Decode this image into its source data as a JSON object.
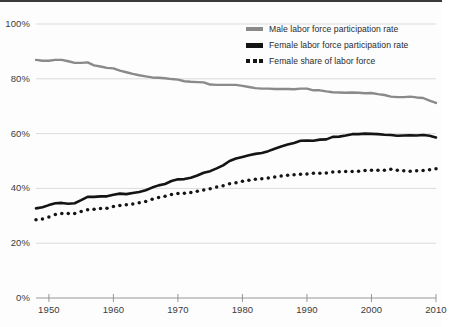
{
  "chart_data": {
    "type": "line",
    "title": "",
    "xlabel": "",
    "ylabel": "",
    "xlim": [
      1948,
      2010
    ],
    "ylim": [
      0,
      100
    ],
    "grid": true,
    "legend_position": "top-right",
    "ytick_labels": [
      "100%",
      "80%",
      "60%",
      "40%",
      "20%",
      "0%"
    ],
    "ytick_values": [
      100,
      80,
      60,
      40,
      20,
      0
    ],
    "xtick_labels": [
      "1950",
      "1960",
      "1970",
      "1980",
      "1990",
      "2000",
      "2010"
    ],
    "xtick_values": [
      1950,
      1960,
      1970,
      1980,
      1990,
      2000,
      2010
    ],
    "x": [
      1948,
      1949,
      1950,
      1951,
      1952,
      1953,
      1954,
      1955,
      1956,
      1957,
      1958,
      1959,
      1960,
      1961,
      1962,
      1963,
      1964,
      1965,
      1966,
      1967,
      1968,
      1969,
      1970,
      1971,
      1972,
      1973,
      1974,
      1975,
      1976,
      1977,
      1978,
      1979,
      1980,
      1981,
      1982,
      1983,
      1984,
      1985,
      1986,
      1987,
      1988,
      1989,
      1990,
      1991,
      1992,
      1993,
      1994,
      1995,
      1996,
      1997,
      1998,
      1999,
      2000,
      2001,
      2002,
      2003,
      2004,
      2005,
      2006,
      2007,
      2008,
      2009,
      2010
    ],
    "series": [
      {
        "name": "Male labor force participation rate",
        "color": "#8a8a8a",
        "style": "solid",
        "values": [
          86.9,
          86.6,
          86.6,
          86.9,
          86.9,
          86.4,
          85.8,
          85.8,
          86.0,
          84.9,
          84.5,
          84.0,
          83.8,
          83.0,
          82.4,
          81.8,
          81.3,
          80.9,
          80.5,
          80.4,
          80.2,
          79.9,
          79.7,
          79.1,
          78.9,
          78.8,
          78.7,
          77.9,
          77.8,
          77.8,
          77.8,
          77.8,
          77.4,
          77.0,
          76.6,
          76.4,
          76.4,
          76.3,
          76.3,
          76.3,
          76.2,
          76.4,
          76.4,
          75.8,
          75.8,
          75.4,
          75.1,
          75.0,
          74.9,
          75.0,
          74.9,
          74.7,
          74.8,
          74.4,
          74.1,
          73.5,
          73.3,
          73.3,
          73.5,
          73.2,
          73.0,
          72.0,
          71.2
        ]
      },
      {
        "name": "Female labor force participation rate",
        "color": "#141414",
        "style": "solid",
        "values": [
          32.7,
          33.1,
          33.9,
          34.6,
          34.7,
          34.4,
          34.6,
          35.7,
          36.9,
          36.9,
          37.1,
          37.1,
          37.7,
          38.1,
          37.9,
          38.3,
          38.7,
          39.3,
          40.3,
          41.1,
          41.6,
          42.7,
          43.3,
          43.4,
          43.9,
          44.7,
          45.7,
          46.3,
          47.3,
          48.4,
          50.0,
          50.9,
          51.5,
          52.1,
          52.6,
          52.9,
          53.6,
          54.5,
          55.3,
          56.0,
          56.6,
          57.4,
          57.5,
          57.4,
          57.8,
          57.9,
          58.8,
          58.9,
          59.3,
          59.8,
          59.8,
          60.0,
          59.9,
          59.8,
          59.6,
          59.5,
          59.2,
          59.3,
          59.4,
          59.3,
          59.5,
          59.2,
          58.6
        ]
      },
      {
        "name": "Female share of labor force",
        "color": "#141414",
        "style": "dotted",
        "values": [
          28.6,
          28.8,
          29.6,
          30.5,
          30.8,
          30.8,
          30.8,
          31.6,
          32.2,
          32.4,
          32.7,
          32.8,
          33.4,
          33.8,
          34.0,
          34.3,
          34.8,
          35.2,
          36.0,
          36.7,
          37.1,
          37.8,
          38.1,
          38.2,
          38.5,
          39.0,
          39.4,
          39.9,
          40.5,
          41.0,
          41.7,
          42.1,
          42.6,
          43.0,
          43.3,
          43.5,
          43.8,
          44.2,
          44.5,
          44.8,
          45.0,
          45.2,
          45.3,
          45.5,
          45.5,
          45.6,
          46.0,
          46.1,
          46.2,
          46.2,
          46.3,
          46.5,
          46.6,
          46.6,
          46.6,
          47.0,
          46.6,
          46.4,
          46.3,
          46.4,
          46.5,
          46.8,
          47.2
        ]
      }
    ]
  }
}
